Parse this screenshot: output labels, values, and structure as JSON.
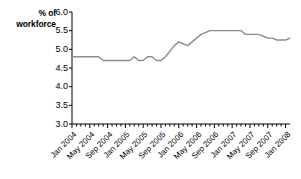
{
  "chart_data": {
    "type": "line",
    "title": "",
    "subtitle": "",
    "xlabel": "",
    "ylabel": "% of workforce",
    "ylim": [
      3.0,
      6.0
    ],
    "ytick_labels": [
      "6.0",
      "5.5",
      "5.0",
      "4.5",
      "4.0",
      "3.5",
      "3.0"
    ],
    "ytick_values": [
      6.0,
      5.5,
      5.0,
      4.5,
      4.0,
      3.5,
      3.0
    ],
    "grid": false,
    "legend": "none",
    "line_color": "#8c8c8c",
    "xtick_labels": [
      "Jan 2004",
      "May 2004",
      "Sep 2004",
      "Jan 2005",
      "May 2005",
      "Sep 2005",
      "Jan 2006",
      "May 2006",
      "Sep 2006",
      "Jan 2007",
      "May 2007",
      "Sep 2007",
      "Jan 2008"
    ],
    "x": [
      "Jan 2004",
      "Feb 2004",
      "Mar 2004",
      "Apr 2004",
      "May 2004",
      "Jun 2004",
      "Jul 2004",
      "Aug 2004",
      "Sep 2004",
      "Oct 2004",
      "Nov 2004",
      "Dec 2004",
      "Jan 2005",
      "Feb 2005",
      "Mar 2005",
      "Apr 2005",
      "May 2005",
      "Jun 2005",
      "Jul 2005",
      "Aug 2005",
      "Sep 2005",
      "Oct 2005",
      "Nov 2005",
      "Dec 2005",
      "Jan 2006",
      "Feb 2006",
      "Mar 2006",
      "Apr 2006",
      "May 2006",
      "Jun 2006",
      "Jul 2006",
      "Aug 2006",
      "Sep 2006",
      "Oct 2006",
      "Nov 2006",
      "Dec 2006",
      "Jan 2007",
      "Feb 2007",
      "Mar 2007",
      "Apr 2007",
      "May 2007",
      "Jun 2007",
      "Jul 2007",
      "Aug 2007",
      "Sep 2007",
      "Oct 2007",
      "Nov 2007",
      "Dec 2007",
      "Jan 2008",
      "Feb 2008"
    ],
    "values": [
      4.8,
      4.8,
      4.8,
      4.8,
      4.8,
      4.8,
      4.8,
      4.7,
      4.7,
      4.7,
      4.7,
      4.7,
      4.7,
      4.7,
      4.8,
      4.7,
      4.7,
      4.8,
      4.8,
      4.7,
      4.7,
      4.8,
      4.95,
      5.1,
      5.2,
      5.15,
      5.1,
      5.2,
      5.3,
      5.4,
      5.45,
      5.5,
      5.5,
      5.5,
      5.5,
      5.5,
      5.5,
      5.5,
      5.5,
      5.4,
      5.4,
      5.4,
      5.4,
      5.35,
      5.3,
      5.3,
      5.25,
      5.25,
      5.25,
      5.3
    ]
  }
}
